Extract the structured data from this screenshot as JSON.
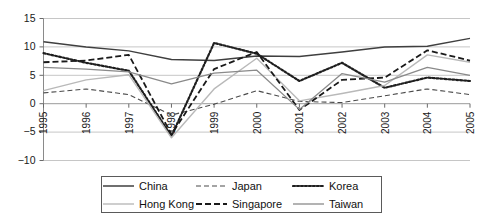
{
  "chart_data": {
    "type": "line",
    "title": "",
    "subtitle": "",
    "xlabel": "",
    "ylabel": "",
    "categories": [
      "1995",
      "1996",
      "1997",
      "1998",
      "1999",
      "2000",
      "2001",
      "2002",
      "2003",
      "2004",
      "2005"
    ],
    "x_tick_labels": [
      "1995",
      "1996",
      "1997",
      "1998",
      "1999",
      "2000",
      "2001",
      "2002",
      "2003",
      "2004",
      "2005"
    ],
    "y_tick_labels": [
      "15",
      "10",
      "5",
      "0",
      "-5",
      "-10"
    ],
    "y_ticks": [
      15,
      10,
      5,
      0,
      -5,
      -10
    ],
    "ylim": [
      -10,
      15
    ],
    "grid": "horizontal",
    "legend_position": "bottom",
    "series": [
      {
        "name": "China",
        "style": "solid",
        "color": "#3f3f3f",
        "width": 1.5,
        "values": [
          10.9,
          10.0,
          9.3,
          7.8,
          7.6,
          8.4,
          8.3,
          9.1,
          10.0,
          10.1,
          11.5
        ]
      },
      {
        "name": "Japan",
        "style": "dashed-thin",
        "color": "#4a4a4a",
        "width": 1.1,
        "values": [
          1.9,
          2.6,
          1.6,
          -2.0,
          -0.1,
          2.3,
          0.4,
          0.2,
          1.4,
          2.6,
          1.6
        ]
      },
      {
        "name": "Korea",
        "style": "dotted",
        "color": "#1f1f1f",
        "width": 2.2,
        "values": [
          8.9,
          7.2,
          5.8,
          -5.7,
          10.7,
          8.8,
          4.0,
          7.2,
          2.8,
          4.6,
          4.0
        ]
      },
      {
        "name": "Hong Kong",
        "style": "solid",
        "color": "#b9b9b9",
        "width": 1.4,
        "values": [
          2.3,
          4.2,
          5.1,
          -6.0,
          2.6,
          8.0,
          0.5,
          1.8,
          3.2,
          8.6,
          7.3
        ]
      },
      {
        "name": "Singapore",
        "style": "dashed-thick",
        "color": "#1a1a1a",
        "width": 1.8,
        "values": [
          7.3,
          7.6,
          8.6,
          -5.4,
          6.1,
          9.1,
          -1.1,
          4.2,
          4.6,
          9.4,
          7.6
        ]
      },
      {
        "name": "Taiwan",
        "style": "solid",
        "color": "#8a8a8a",
        "width": 1.3,
        "values": [
          6.4,
          6.1,
          5.6,
          3.5,
          5.4,
          5.9,
          -1.0,
          5.3,
          3.8,
          6.4,
          5.0
        ]
      }
    ]
  },
  "legend": {
    "entries": [
      {
        "label": "China",
        "series": "China"
      },
      {
        "label": "Japan",
        "series": "Japan"
      },
      {
        "label": "Korea",
        "series": "Korea"
      },
      {
        "label": "Hong Kong",
        "series": "Hong Kong"
      },
      {
        "label": "Singapore",
        "series": "Singapore"
      },
      {
        "label": "Taiwan",
        "series": "Taiwan"
      }
    ]
  },
  "axes": {
    "y_axis_name": "value-axis",
    "x_axis_name": "year-axis"
  }
}
